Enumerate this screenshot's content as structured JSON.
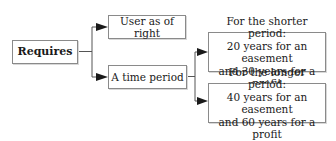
{
  "diagram": {
    "root": {
      "label": "Requires"
    },
    "branches": [
      {
        "label": "User as of right"
      },
      {
        "label": "A time period"
      }
    ],
    "sub_branches": [
      {
        "lines": [
          "For the shorter period:",
          "20 years for an easement",
          "and 30 years for a profit"
        ]
      },
      {
        "lines": [
          "For the longer period:",
          "40 years for an easement",
          "and 60 years for a profit"
        ]
      }
    ],
    "colors": {
      "line": "#555555",
      "border": "#8a8a8a",
      "arrow": "#1a1a1a"
    }
  }
}
